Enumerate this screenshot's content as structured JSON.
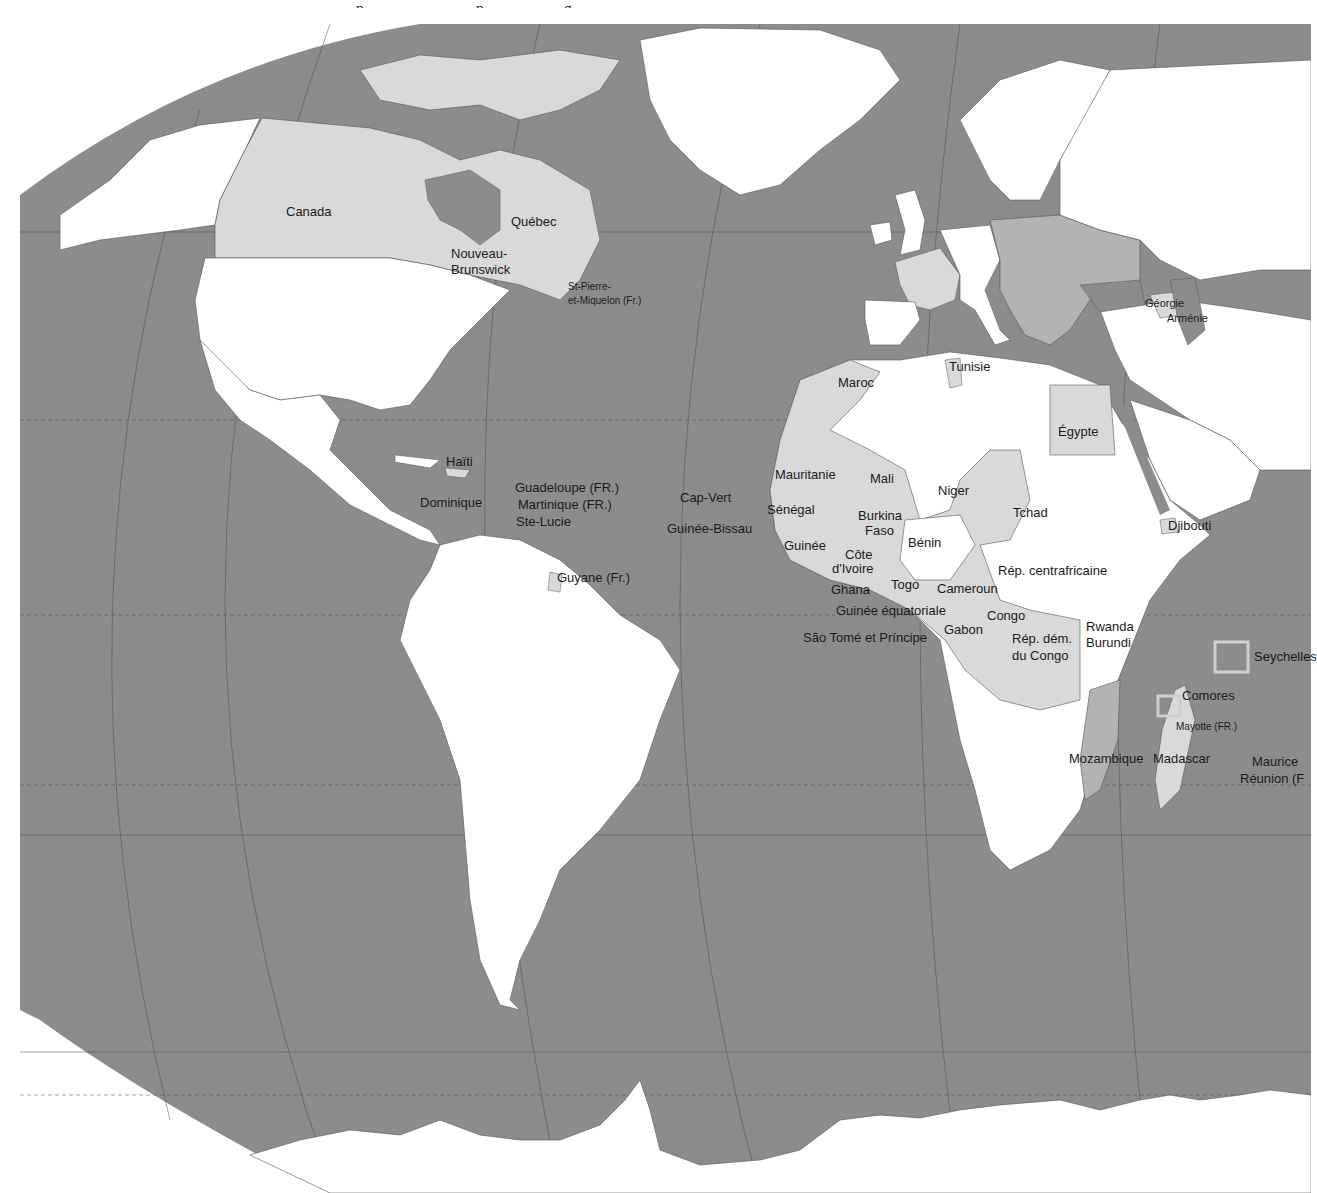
{
  "map": {
    "type": "political world map (French labels), Atlantic-centered",
    "colors": {
      "ocean": "#8c8c8c",
      "land_default": "#ffffff",
      "land_highlight": "#d9d9d9",
      "land_europe_member": "#b3b3b3",
      "border": "#555555",
      "page_bg": "#ffffff"
    },
    "top_text_cut": "…, ……p…………………p……………g, ……………………………………………………"
  },
  "labels": {
    "canada": "Canada",
    "quebec": "Québec",
    "nouveau_brunswick_1": "Nouveau-",
    "nouveau_brunswick_2": "Brunswick",
    "st_pierre_1": "St-Pierre-",
    "st_pierre_2": "et-Miquelon (Fr.)",
    "haiti": "Haïti",
    "dominique": "Dominique",
    "guadeloupe": "Guadeloupe (FR.)",
    "martinique": "Martinique (FR.)",
    "ste_lucie": "Ste-Lucie",
    "guyane": "Guyane (Fr.)",
    "cap_vert": "Cap-Vert",
    "guinee_bissau": "Guinée-Bissau",
    "maroc": "Maroc",
    "tunisie": "Tunisie",
    "egypte": "Égypte",
    "mauritanie": "Mauritanie",
    "mali": "Mali",
    "niger": "Niger",
    "tchad": "Tchad",
    "senegal": "Sénégal",
    "burkina_1": "Burkina",
    "burkina_2": "Faso",
    "benin": "Bénin",
    "guinee": "Guinée",
    "cote_1": "Côte",
    "cote_2": "d'Ivoire",
    "ghana": "Ghana",
    "togo": "Togo",
    "cameroun": "Cameroun",
    "rep_centrafricaine": "Rép. centrafricaine",
    "guinee_equatoriale": "Guinée équatoriale",
    "gabon": "Gabon",
    "congo": "Congo",
    "sao_tome": "São Tomé et Príncipe",
    "rdc_1": "Rép. dém.",
    "rdc_2": "du Congo",
    "rwanda": "Rwanda",
    "burundi": "Burundi",
    "djibouti": "Djibouti",
    "georgie": "Géorgie",
    "armenie": "Arménie",
    "seychelles": "Seychelles",
    "comores": "Comores",
    "mayotte": "Mayotte (FR.)",
    "mozambique": "Mozambique",
    "madagascar": "Madascar",
    "maurice": "Maurice",
    "reunion": "Réunion (F"
  }
}
